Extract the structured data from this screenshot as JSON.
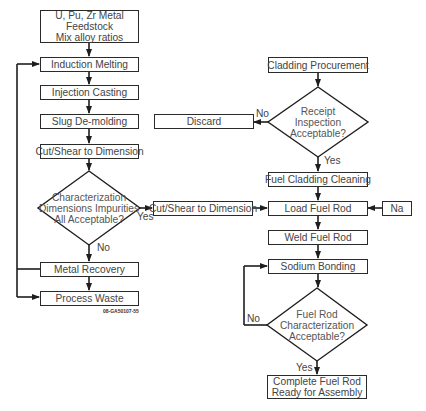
{
  "diagram": {
    "left_column": {
      "feedstock": [
        "U, Pu, Zr Metal",
        "Feedstock",
        "Mix alloy ratios"
      ],
      "induction_melting": "Induction Melting",
      "injection_casting": "Injection Casting",
      "slug_demolding": "Slug De-molding",
      "cut_shear": "Cut/Shear to Dimension",
      "decision": [
        "Characterization",
        "Dimensions Impurities",
        "All Acceptable?"
      ],
      "decision_yes": "Yes",
      "decision_no": "No",
      "metal_recovery": "Metal Recovery",
      "process_waste": "Process Waste",
      "figure_code": "08-GA50107-55"
    },
    "middle": {
      "cut_shear": "Cut/Shear to Dimension",
      "discard": "Discard"
    },
    "right_column": {
      "cladding_procurement": "Cladding Procurement",
      "receipt_decision": [
        "Receipt",
        "Inspection",
        "Acceptable?"
      ],
      "receipt_no": "No",
      "receipt_yes": "Yes",
      "fuel_cladding_cleaning": "Fuel Cladding Cleaning",
      "load_fuel_rod": "Load Fuel Rod",
      "na": "Na",
      "weld_fuel_rod": "Weld Fuel Rod",
      "sodium_bonding": "Sodium Bonding",
      "rod_decision": [
        "Fuel Rod",
        "Characterization",
        "Acceptable?"
      ],
      "rod_no": "No",
      "rod_yes": "Yes",
      "complete": [
        "Complete Fuel Rod",
        "Ready for Assembly"
      ]
    }
  },
  "colors": {
    "line": "#1e1e1e",
    "text": "#444444",
    "background": "#ffffff"
  }
}
